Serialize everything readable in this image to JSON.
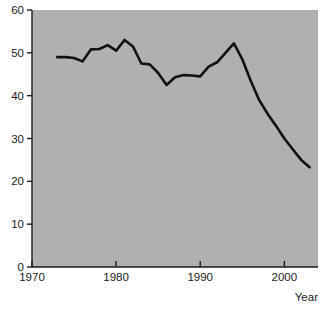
{
  "chart_data": {
    "type": "line",
    "title": "",
    "subtitle": "",
    "xlabel": "Year",
    "ylabel": "",
    "xlim": [
      1970,
      2004
    ],
    "ylim": [
      0,
      60
    ],
    "grid": false,
    "legend": null,
    "background_color": "#b0b0b0",
    "line_color": "#111111",
    "axis_color": "#1a1a1a",
    "xticks": [
      1970,
      1980,
      1990,
      2000
    ],
    "xtick_labels": [
      "1970",
      "1980",
      "1990",
      "2000"
    ],
    "yticks": [
      0,
      10,
      20,
      30,
      40,
      50,
      60
    ],
    "ytick_labels": [
      "0",
      "10",
      "20",
      "30",
      "40",
      "50",
      "60"
    ],
    "series": [
      {
        "name": "",
        "x": [
          1973,
          1974,
          1975,
          1976,
          1977,
          1978,
          1979,
          1980,
          1981,
          1982,
          1983,
          1984,
          1985,
          1986,
          1987,
          1988,
          1989,
          1990,
          1991,
          1992,
          1993,
          1994,
          1995,
          1996,
          1997,
          1998,
          1999,
          2000,
          2001,
          2002,
          2003
        ],
        "values": [
          49.0,
          49.0,
          48.8,
          48.0,
          50.8,
          50.9,
          51.8,
          50.5,
          53.0,
          51.5,
          47.5,
          47.3,
          45.3,
          42.5,
          44.3,
          44.8,
          44.7,
          44.5,
          46.8,
          47.8,
          50.0,
          52.2,
          48.5,
          43.5,
          39.0,
          35.8,
          33.0,
          30.0,
          27.5,
          25.0,
          23.3
        ]
      }
    ],
    "annotations": []
  },
  "axes": {
    "x_axis_title": "Year"
  }
}
